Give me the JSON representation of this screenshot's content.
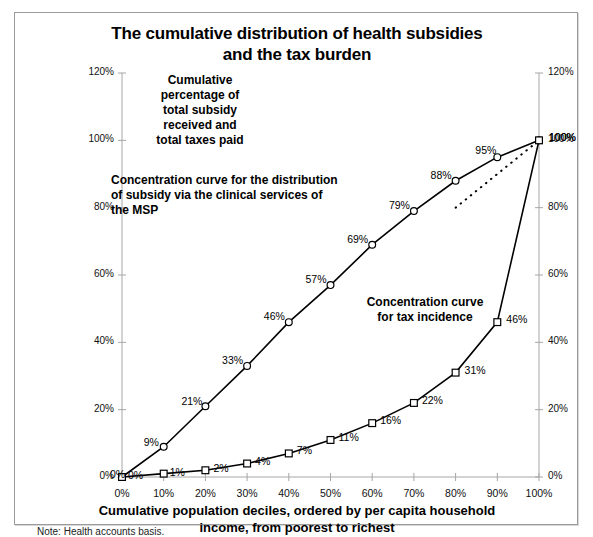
{
  "chart_data": {
    "type": "line",
    "title": "The cumulative distribution of health subsidies and the tax burden",
    "title_line1": "The cumulative distribution of health subsidies",
    "title_line2": "and the tax burden",
    "xlabel": "Cumulative population deciles, ordered by per capita household income, from poorest to richest",
    "xlabel_line1": "Cumulative population deciles, ordered by per capita household",
    "xlabel_line2": "income, from poorest to richest",
    "ylabel": "Cumulative percentage of total subsidy received and total taxes paid",
    "ylabel_annotation": "Cumulative percentage of total subsidy received and total taxes paid",
    "note": "Note: Health accounts basis.",
    "x": [
      0,
      10,
      20,
      30,
      40,
      50,
      60,
      70,
      80,
      90,
      100
    ],
    "xticklabels": [
      "0%",
      "10%",
      "20%",
      "30%",
      "40%",
      "50%",
      "60%",
      "70%",
      "80%",
      "90%",
      "100%"
    ],
    "yticks": [
      0,
      20,
      40,
      60,
      80,
      100,
      120
    ],
    "yticklabels": [
      "0%",
      "20%",
      "40%",
      "60%",
      "80%",
      "100%",
      "120%"
    ],
    "ylim": [
      0,
      120
    ],
    "xlim": [
      0,
      100
    ],
    "grid": false,
    "legend": "none",
    "series": [
      {
        "name": "Concentration curve for the distribution of subsidy via the clinical services of the MSP",
        "marker": "circle",
        "values": [
          0,
          9,
          21,
          33,
          46,
          57,
          69,
          79,
          88,
          95,
          100
        ],
        "labels": [
          "0%",
          "9%",
          "21%",
          "33%",
          "46%",
          "57%",
          "69%",
          "79%",
          "88%",
          "95%",
          "100%"
        ]
      },
      {
        "name": "Concentration curve for tax incidence",
        "marker": "square",
        "values": [
          0,
          1,
          2,
          4,
          7,
          11,
          16,
          22,
          31,
          46,
          100
        ],
        "labels": [
          "0%",
          "1%",
          "2%",
          "4%",
          "7%",
          "11%",
          "16%",
          "22%",
          "31%",
          "46%",
          "100%"
        ]
      },
      {
        "name": "Line of equality (dotted reference)",
        "marker": "none",
        "style": "dotted",
        "x": [
          80,
          100
        ],
        "values": [
          80,
          100
        ]
      }
    ],
    "annotations": [
      {
        "id": "cumulative-axis-note",
        "text": "Cumulative percentage of total subsidy received and total taxes paid",
        "lines": [
          "Cumulative",
          "percentage of",
          "total subsidy",
          "received and",
          "total taxes paid"
        ]
      },
      {
        "id": "subsidy-curve-label",
        "text": "Concentration curve for the distribution of subsidy via the clinical services of the MSP",
        "lines": [
          "Concentration curve for the distribution",
          "of subsidy via the clinical services of",
          "the MSP"
        ]
      },
      {
        "id": "tax-curve-label",
        "text": "Concentration curve for tax incidence",
        "lines": [
          "Concentration curve",
          "for tax incidence"
        ]
      }
    ],
    "colors": {
      "curve": "#000000",
      "axis": "#a6a6a6",
      "background": "#ffffff",
      "border": "#9a9a9a"
    }
  }
}
